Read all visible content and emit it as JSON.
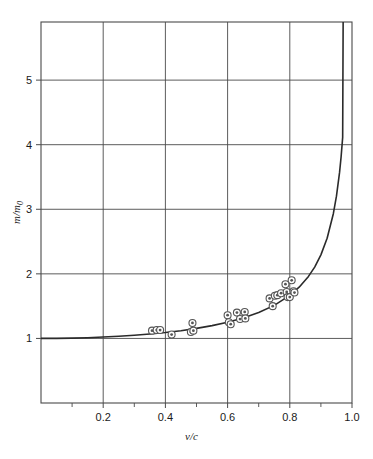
{
  "figure": {
    "name": "relativistic-mass-vs-velocity",
    "background": "#ffffff",
    "line_color": "#2b2b2b",
    "grid_color": "#4a4a4a",
    "marker_color": "#555555"
  },
  "chart_data": {
    "type": "line",
    "title": "",
    "subtitle": "",
    "xlabel": "v/c",
    "ylabel": "m/m0",
    "ylabel_parts": {
      "main": "m/m",
      "subscript": "0"
    },
    "xlim": [
      0,
      1.0
    ],
    "ylim": [
      0,
      5.9
    ],
    "grid": true,
    "legend": "none",
    "xticks": [
      0.2,
      0.4,
      0.6,
      0.8,
      1.0
    ],
    "xtick_labels": [
      "0.2",
      "0.4",
      "0.6",
      "0.8",
      "1.0"
    ],
    "xminor_ticks": [
      0.1,
      0.3,
      0.5,
      0.7,
      0.9
    ],
    "yticks": [
      1,
      2,
      3,
      4,
      5
    ],
    "ytick_labels": [
      "1",
      "2",
      "3",
      "4",
      "5"
    ],
    "series": [
      {
        "name": "theory",
        "type": "line",
        "formula": "m/m0 = 1/sqrt(1-(v/c)^2)",
        "x": [
          0.0,
          0.05,
          0.1,
          0.15,
          0.2,
          0.25,
          0.3,
          0.35,
          0.4,
          0.45,
          0.5,
          0.55,
          0.6,
          0.65,
          0.7,
          0.75,
          0.8,
          0.83,
          0.86,
          0.88,
          0.9,
          0.92,
          0.94,
          0.95,
          0.96,
          0.965,
          0.97
        ],
        "y": [
          1.0,
          1.001,
          1.005,
          1.011,
          1.021,
          1.033,
          1.048,
          1.068,
          1.091,
          1.12,
          1.155,
          1.198,
          1.25,
          1.316,
          1.4,
          1.512,
          1.667,
          1.793,
          1.96,
          2.105,
          2.294,
          2.552,
          2.931,
          3.203,
          3.571,
          3.814,
          4.113
        ]
      },
      {
        "name": "measured-points",
        "type": "scatter",
        "marker": "circle-dot",
        "points": [
          {
            "x": 0.357,
            "y": 1.12
          },
          {
            "x": 0.372,
            "y": 1.13
          },
          {
            "x": 0.383,
            "y": 1.13
          },
          {
            "x": 0.42,
            "y": 1.06
          },
          {
            "x": 0.482,
            "y": 1.1
          },
          {
            "x": 0.49,
            "y": 1.12
          },
          {
            "x": 0.487,
            "y": 1.24
          },
          {
            "x": 0.6,
            "y": 1.36
          },
          {
            "x": 0.604,
            "y": 1.25
          },
          {
            "x": 0.61,
            "y": 1.22
          },
          {
            "x": 0.63,
            "y": 1.4
          },
          {
            "x": 0.64,
            "y": 1.3
          },
          {
            "x": 0.655,
            "y": 1.41
          },
          {
            "x": 0.657,
            "y": 1.31
          },
          {
            "x": 0.735,
            "y": 1.62
          },
          {
            "x": 0.745,
            "y": 1.5
          },
          {
            "x": 0.752,
            "y": 1.66
          },
          {
            "x": 0.76,
            "y": 1.67
          },
          {
            "x": 0.772,
            "y": 1.7
          },
          {
            "x": 0.786,
            "y": 1.84
          },
          {
            "x": 0.79,
            "y": 1.72
          },
          {
            "x": 0.793,
            "y": 1.64
          },
          {
            "x": 0.8,
            "y": 1.64
          },
          {
            "x": 0.806,
            "y": 1.9
          },
          {
            "x": 0.812,
            "y": 1.73
          },
          {
            "x": 0.815,
            "y": 1.71
          }
        ]
      }
    ]
  }
}
